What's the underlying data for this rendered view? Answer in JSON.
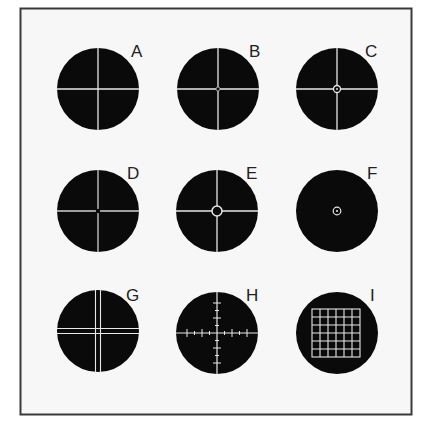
{
  "figure": {
    "frame_color": "#3a3a3a",
    "background": "#f7f7f7",
    "disc_color": "#0a0a0a",
    "line_color": "#e8e8e8",
    "reticles": [
      {
        "label": "A",
        "type": "simple-crosshair"
      },
      {
        "label": "B",
        "type": "crosshair-small-center-dot"
      },
      {
        "label": "C",
        "type": "crosshair-center-circle"
      },
      {
        "label": "D",
        "type": "crosshair-center-dot"
      },
      {
        "label": "E",
        "type": "crosshair-open-circle"
      },
      {
        "label": "F",
        "type": "center-circle-dot-only"
      },
      {
        "label": "G",
        "type": "double-crosshair"
      },
      {
        "label": "H",
        "type": "scaled-crosshair"
      },
      {
        "label": "I",
        "type": "grid"
      }
    ]
  }
}
